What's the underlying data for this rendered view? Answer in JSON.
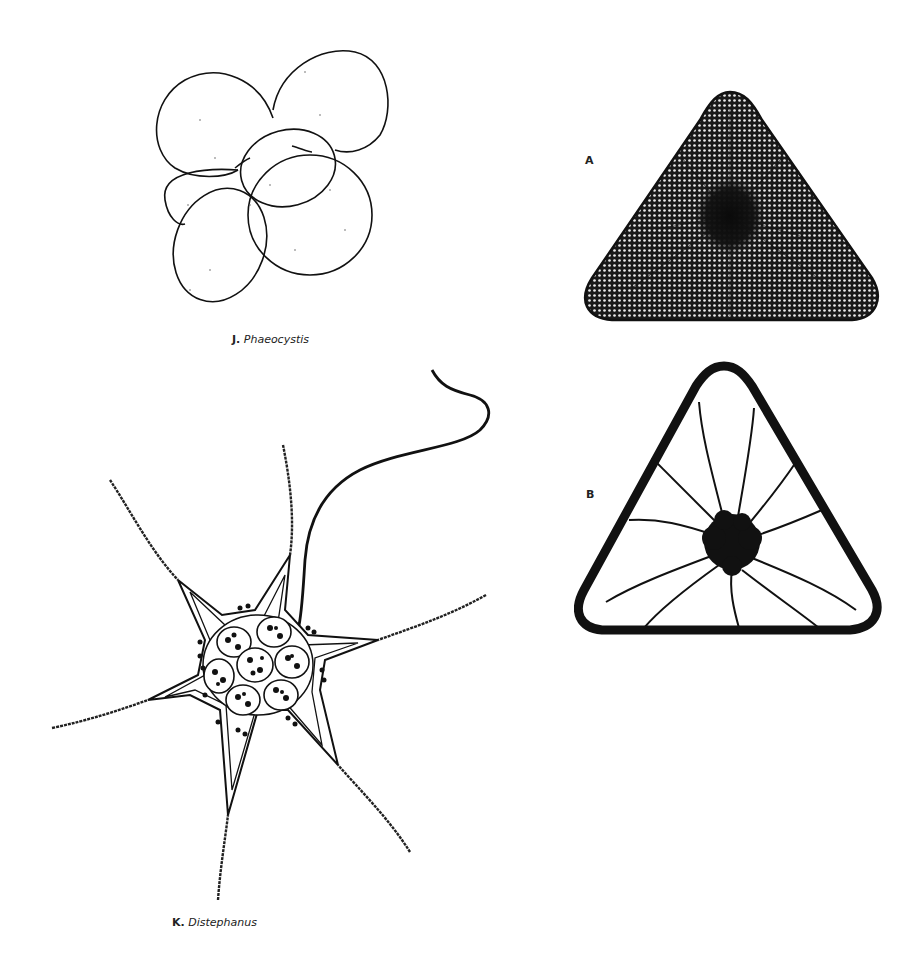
{
  "plate": {
    "background_color": "#ffffff",
    "ink_color": "#111111",
    "figures": [
      {
        "id": "J",
        "letter": "J.",
        "genus": "Phaeocystis",
        "description": "colony of overlapping oval cells"
      },
      {
        "id": "K",
        "letter": "K.",
        "genus": "Distephanus",
        "description": "star-shaped silicoflagellate skeleton with six spines, seven inner cells and a long flagellum"
      },
      {
        "id": "AB",
        "panels": [
          {
            "letter": "A",
            "description": "triangular diatom valve with areolate (dotted) surface and dark central area"
          },
          {
            "letter": "B",
            "description": "triangular diatom valve outline with radiating strands from dark center"
          }
        ]
      }
    ]
  }
}
